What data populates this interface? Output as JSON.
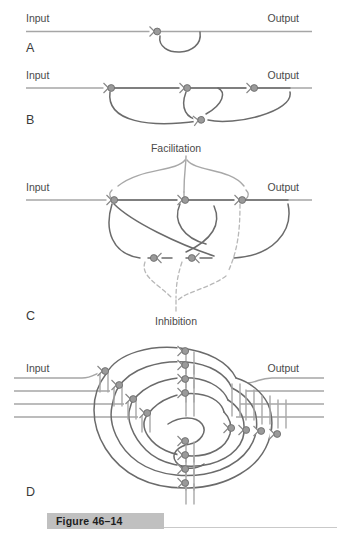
{
  "figure": {
    "caption": "Figure 46–14",
    "labels": {
      "input": "Input",
      "output": "Output",
      "facilitation": "Facilitation",
      "inhibition": "Inhibition"
    },
    "panels": [
      {
        "id": "A",
        "letter": "A",
        "input_label": "Input",
        "output_label": "Output",
        "description": "Single reverberating circuit with one feedback collateral",
        "synapse_count": 1
      },
      {
        "id": "B",
        "letter": "B",
        "input_label": "Input",
        "output_label": "Output",
        "description": "Reverberating circuit with multiple collateral feedback loops",
        "synapse_count": 4
      },
      {
        "id": "C",
        "letter": "C",
        "input_label": "Input",
        "output_label": "Output",
        "annotation_top": "Facilitation",
        "annotation_bottom": "Inhibition",
        "description": "Reverberating circuit with facilitatory and inhibitory inputs to the feedback pathway",
        "synapse_count": 5
      },
      {
        "id": "D",
        "letter": "D",
        "input_label": "Input",
        "output_label": "Output",
        "description": "Multiple parallel reverberating circuits arranged in a nested spiral",
        "synapse_count": 16,
        "input_fiber_count": 4,
        "output_fiber_count": 4
      }
    ]
  },
  "colors": {
    "axis": "#a6a6a6",
    "neuron_dark": "#6b6b6b",
    "neuron_light": "#a8a8a8",
    "dashed_inhibitory": "#b8b8b8",
    "synapse_fill": "#9a9a9a",
    "caption_highlight": "#c0c0c0",
    "text": "#4a4a4a",
    "background": "#ffffff"
  }
}
